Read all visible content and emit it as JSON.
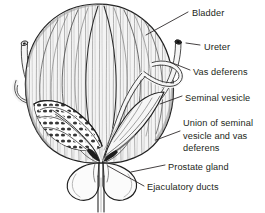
{
  "figure": {
    "kind": "anatomical-illustration",
    "style": "black-and-white pen-and-ink line drawing with hatched shading",
    "background_color": "#ffffff",
    "ink_color": "#231f20",
    "fill_color": "#f2f2f2",
    "shade_color": "#d8d8d8"
  },
  "labels": [
    {
      "id": "bladder",
      "text": "Bladder",
      "x": 192,
      "y": 13
    },
    {
      "id": "ureter",
      "text": "Ureter",
      "x": 204,
      "y": 47
    },
    {
      "id": "vas-deferens",
      "text": "Vas deferens",
      "x": 193,
      "y": 72
    },
    {
      "id": "seminal-vesicle",
      "text": "Seminal vesicle",
      "x": 185,
      "y": 98
    },
    {
      "id": "union",
      "text": "Union of seminal\nvesicle and vas\ndeferens",
      "x": 183,
      "y": 123
    },
    {
      "id": "prostate-gland",
      "text": "Prostate gland",
      "x": 168,
      "y": 167
    },
    {
      "id": "ejaculatory-ducts",
      "text": "Ejaculatory ducts",
      "x": 147,
      "y": 187
    }
  ],
  "structures": [
    {
      "id": "bladder",
      "name": "Bladder",
      "note": "large dome-shaped organ with vertical detrusor muscle striations"
    },
    {
      "id": "ureter-left",
      "name": "Left ureter",
      "note": "cut tube entering upper left, dark elliptical lumen at cut end"
    },
    {
      "id": "ureter-right",
      "name": "Right ureter",
      "note": "cut tube entering upper right, dark elliptical lumen at cut end"
    },
    {
      "id": "vas-deferens-left",
      "name": "Left vas deferens",
      "note": "tube crossing behind bladder toward midline"
    },
    {
      "id": "vas-deferens-right",
      "name": "Right vas deferens",
      "note": "tube looping over the right ureter"
    },
    {
      "id": "seminal-vesicle-left",
      "name": "Left seminal vesicle",
      "note": "shown sectioned, revealing convoluted internal chambers"
    },
    {
      "id": "seminal-vesicle-right",
      "name": "Right seminal vesicle",
      "note": "intact lobulated sac"
    },
    {
      "id": "prostate-gland",
      "name": "Prostate gland",
      "note": "two rounded lobes below the bladder base"
    },
    {
      "id": "ejaculatory-ducts",
      "name": "Ejaculatory ducts",
      "note": "short ducts piercing the prostate at the midline"
    },
    {
      "id": "urethra",
      "name": "Urethra",
      "note": "narrow stem descending from the prostate"
    }
  ]
}
